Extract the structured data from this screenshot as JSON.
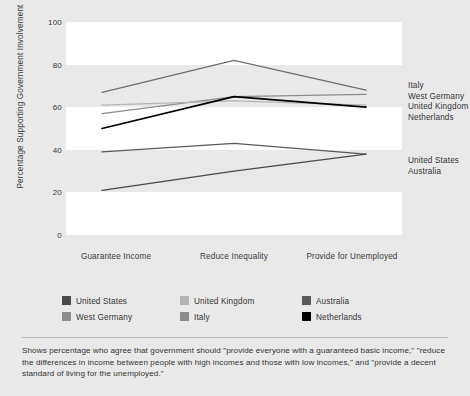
{
  "chart_data": {
    "type": "line",
    "title": "",
    "xlabel": "",
    "ylabel": "Percentage Supporting Government Involvement",
    "ylim": [
      0,
      100
    ],
    "yticks": [
      0,
      20,
      40,
      60,
      80,
      100
    ],
    "grid": false,
    "legend_position": "below-plot",
    "categories": [
      "Guarantee Income",
      "Reduce Inequality",
      "Provide for Unemployed"
    ],
    "series": [
      {
        "name": "Italy",
        "values": [
          67,
          82,
          68
        ],
        "color": "#6e6e6e",
        "end_label": "Italy"
      },
      {
        "name": "West Germany",
        "values": [
          57,
          65,
          66
        ],
        "color": "#8c8c8c",
        "end_label": "West Germany"
      },
      {
        "name": "United Kingdom",
        "values": [
          61,
          63,
          61
        ],
        "color": "#b4b4b4",
        "end_label": "United Kingdom"
      },
      {
        "name": "Netherlands",
        "values": [
          50,
          65,
          60
        ],
        "color": "#000000",
        "end_label": "Netherlands"
      },
      {
        "name": "Australia",
        "values": [
          39,
          43,
          38
        ],
        "color": "#5a5a5a",
        "end_label": "United States"
      },
      {
        "name": "United States",
        "values": [
          21,
          30,
          38
        ],
        "color": "#4a4a4a",
        "end_label": "Australia"
      }
    ],
    "end_labels": [
      "Italy",
      "West Germany",
      "United Kingdom",
      "Netherlands",
      "United States",
      "Australia"
    ]
  },
  "axes": {
    "y_title": "Percentage Supporting Government Involvement",
    "y_ticks": [
      "100",
      "80",
      "60",
      "40",
      "20",
      "0"
    ],
    "x_ticks": [
      "Guarantee Income",
      "Reduce Inequality",
      "Provide for Unemployed"
    ]
  },
  "right_labels": {
    "upper": [
      "Italy",
      "West Germany",
      "United Kingdom",
      "Netherlands"
    ],
    "lower": [
      "United States",
      "Australia"
    ]
  },
  "legend": {
    "items": [
      {
        "label": "United States",
        "color": "#4a4a4a"
      },
      {
        "label": "United Kingdom",
        "color": "#b4b4b4"
      },
      {
        "label": "Australia",
        "color": "#5a5a5a"
      },
      {
        "label": "West Germany",
        "color": "#8c8c8c"
      },
      {
        "label": "Italy",
        "color": "#8c8c8c"
      },
      {
        "label": "Netherlands",
        "color": "#000000"
      }
    ]
  },
  "caption": {
    "text": "Shows percentage who agree that government should \"provide everyone with a guaranteed basic income,\" \"reduce the differences in income between people with high incomes and those with low incomes,\" and \"provide a decent standard of living for the unemployed.\""
  }
}
